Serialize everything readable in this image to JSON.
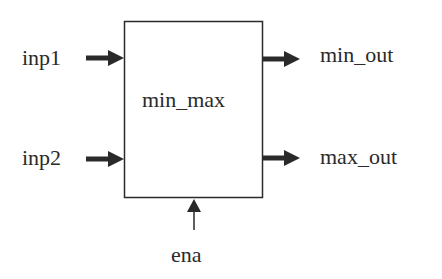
{
  "diagram": {
    "block": {
      "label": "min_max"
    },
    "inputs": [
      {
        "label": "inp1"
      },
      {
        "label": "inp2"
      }
    ],
    "outputs": [
      {
        "label": "min_out"
      },
      {
        "label": "max_out"
      }
    ],
    "control": {
      "label": "ena"
    },
    "colors": {
      "line": "#2a2a2a",
      "background": "#ffffff"
    }
  }
}
